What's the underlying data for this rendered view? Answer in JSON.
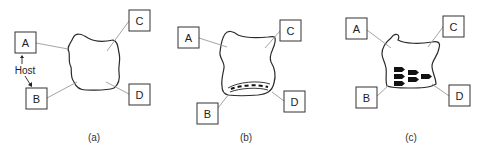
{
  "panels": [
    {
      "id": "a",
      "caption": "(a)",
      "labels": {
        "A": "A",
        "B": "B",
        "C": "C",
        "D": "D"
      },
      "host_label": "Host",
      "feature": "none"
    },
    {
      "id": "b",
      "caption": "(b)",
      "labels": {
        "A": "A",
        "B": "B",
        "C": "C",
        "D": "D"
      },
      "feature": "dashed-band"
    },
    {
      "id": "c",
      "caption": "(c)",
      "labels": {
        "A": "A",
        "B": "B",
        "C": "C",
        "D": "D"
      },
      "feature": "arrow-markers",
      "marker_count": 6
    }
  ],
  "colors": {
    "outline": "#2a2a2a",
    "box_stroke": "#333333",
    "leader": "#9a9a9a",
    "marker_fill": "#111111"
  }
}
